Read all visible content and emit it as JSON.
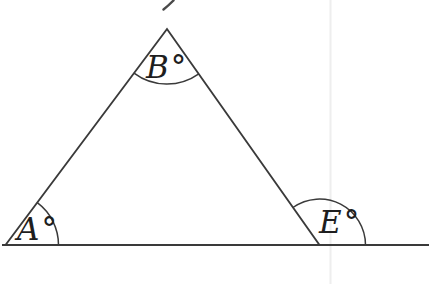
{
  "figure": {
    "type": "geometry-angle-diagram",
    "labels": {
      "angle_a": "A°",
      "angle_b": "B°",
      "angle_e": "E°"
    },
    "colors": {
      "stroke": "#3a3a3a",
      "label_text": "#1e1e1e",
      "background": "#ffffff",
      "fold_line": "#eeeeee"
    }
  }
}
